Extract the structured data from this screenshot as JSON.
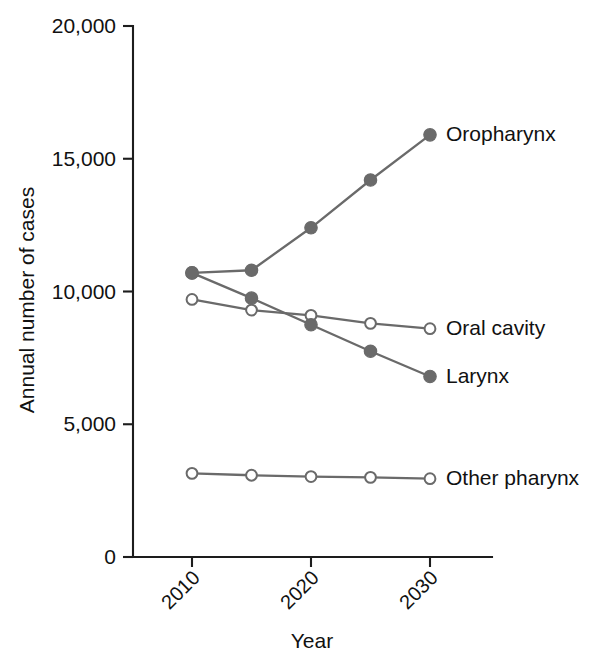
{
  "chart_data": {
    "type": "line",
    "title": "",
    "xlabel": "Year",
    "ylabel": "Annual number of cases",
    "x": [
      2010,
      2015,
      2020,
      2025,
      2030
    ],
    "xlim": [
      2008,
      2032
    ],
    "ylim": [
      0,
      20000
    ],
    "xticks": [
      2010,
      2020,
      2030
    ],
    "xtick_labels": [
      "2010",
      "2020",
      "2030"
    ],
    "yticks": [
      0,
      5000,
      10000,
      15000,
      20000
    ],
    "ytick_labels": [
      "0",
      "5,000",
      "10,000",
      "15,000",
      "20,000"
    ],
    "grid": false,
    "legend_position": "inline-right-of-line-end",
    "series": [
      {
        "name": "Oropharynx",
        "label": "Oropharynx",
        "marker": "filled-circle",
        "color": "#6a6a6a",
        "values": [
          10700,
          10800,
          12400,
          14200,
          15900
        ]
      },
      {
        "name": "Oral cavity",
        "label": "Oral cavity",
        "marker": "open-circle",
        "color": "#6a6a6a",
        "values": [
          9700,
          9300,
          9100,
          8800,
          8600
        ]
      },
      {
        "name": "Larynx",
        "label": "Larynx",
        "marker": "filled-circle",
        "color": "#6a6a6a",
        "values": [
          10700,
          9750,
          8750,
          7750,
          6800
        ]
      },
      {
        "name": "Other pharynx",
        "label": "Other pharynx",
        "marker": "open-circle",
        "color": "#6a6a6a",
        "values": [
          3150,
          3080,
          3030,
          3000,
          2950
        ]
      }
    ]
  },
  "axes": {
    "y_title": "Annual number of cases",
    "x_title": "Year"
  },
  "colors": {
    "axis": "#1d1d1d",
    "series_gray": "#6a6a6a",
    "marker_fill_open": "#ffffff",
    "text": "#111111",
    "background": "#ffffff"
  }
}
